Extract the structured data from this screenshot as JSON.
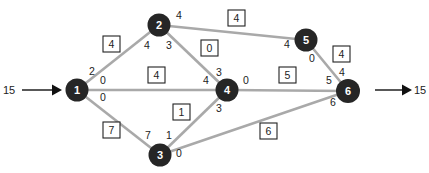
{
  "diagram": {
    "type": "network-flow",
    "source": {
      "node": "1",
      "supply": "15"
    },
    "sink": {
      "node": "6",
      "demand": "15"
    },
    "nodes": [
      {
        "id": "1",
        "x": 77,
        "y": 90
      },
      {
        "id": "2",
        "x": 159,
        "y": 25
      },
      {
        "id": "3",
        "x": 160,
        "y": 155
      },
      {
        "id": "4",
        "x": 227,
        "y": 90
      },
      {
        "id": "5",
        "x": 306,
        "y": 40
      },
      {
        "id": "6",
        "x": 348,
        "y": 91
      }
    ],
    "edges": [
      {
        "from": "1",
        "to": "2",
        "flow": "4",
        "label_from": "2",
        "label_to": "4"
      },
      {
        "from": "1",
        "to": "4",
        "flow": "4",
        "label_from": "0",
        "label_to": "4"
      },
      {
        "from": "1",
        "to": "3",
        "flow": "7",
        "label_from": "0",
        "label_to": "7"
      },
      {
        "from": "2",
        "to": "5",
        "flow": "4",
        "label_from": "4",
        "label_to": "4"
      },
      {
        "from": "2",
        "to": "4",
        "flow": "0",
        "label_from": "3",
        "label_to": "3"
      },
      {
        "from": "3",
        "to": "4",
        "flow": "1",
        "label_from": "1",
        "label_to": "3"
      },
      {
        "from": "4",
        "to": "6",
        "flow": "5",
        "label_from": "0",
        "label_to": "5"
      },
      {
        "from": "5",
        "to": "6",
        "flow": "4",
        "label_from": "0",
        "label_to": "4"
      },
      {
        "from": "3",
        "to": "6",
        "flow": "6",
        "label_from": "0",
        "label_to": "6"
      }
    ]
  },
  "colors": {
    "node_fill": "#262626",
    "edge": "#a9a9a9",
    "text": "#222222"
  }
}
